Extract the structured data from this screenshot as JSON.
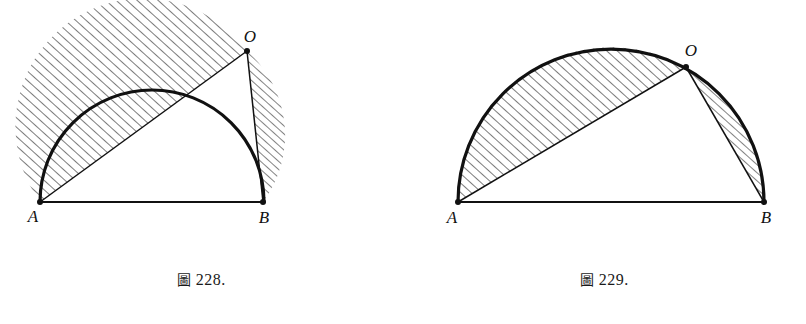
{
  "page": {
    "background_color": "#ffffff",
    "ink_color": "#111111",
    "figure_count": 2
  },
  "figures": [
    {
      "id": "fig-228",
      "caption_cjk": "圖",
      "caption_number": "228.",
      "caption_full": "圖 228.",
      "points": {
        "A": {
          "label": "A",
          "x": 40,
          "y": 202
        },
        "B": {
          "label": "B",
          "x": 263,
          "y": 202
        },
        "O": {
          "label": "O",
          "x": 247,
          "y": 51
        }
      },
      "circle": {
        "cx": 152,
        "cy": 202,
        "r": 112
      },
      "diameter_label": "AB",
      "chords": [
        "AO",
        "OB"
      ],
      "hatched_regions": [
        {
          "name": "segment-AO",
          "bounded_by": [
            "chord AO",
            "arc AO"
          ]
        },
        {
          "name": "segment-OB",
          "bounded_by": [
            "chord OB",
            "arc OB"
          ]
        }
      ]
    },
    {
      "id": "fig-229",
      "caption_cjk": "圖",
      "caption_number": "229.",
      "caption_full": "圖 229.",
      "points": {
        "A": {
          "label": "A",
          "x": 55,
          "y": 202
        },
        "B": {
          "label": "B",
          "x": 361,
          "y": 202
        },
        "O": {
          "label": "O",
          "x": 283,
          "y": 67
        }
      },
      "circle": {
        "cx": 208,
        "cy": 202,
        "r": 153
      },
      "diameter_label": "AB",
      "chords": [
        "AO",
        "OB"
      ],
      "hatched_regions": [
        {
          "name": "segment-AO",
          "bounded_by": [
            "chord AO",
            "arc AO"
          ]
        },
        {
          "name": "segment-OB",
          "bounded_by": [
            "chord OB",
            "arc OB"
          ]
        }
      ]
    }
  ]
}
